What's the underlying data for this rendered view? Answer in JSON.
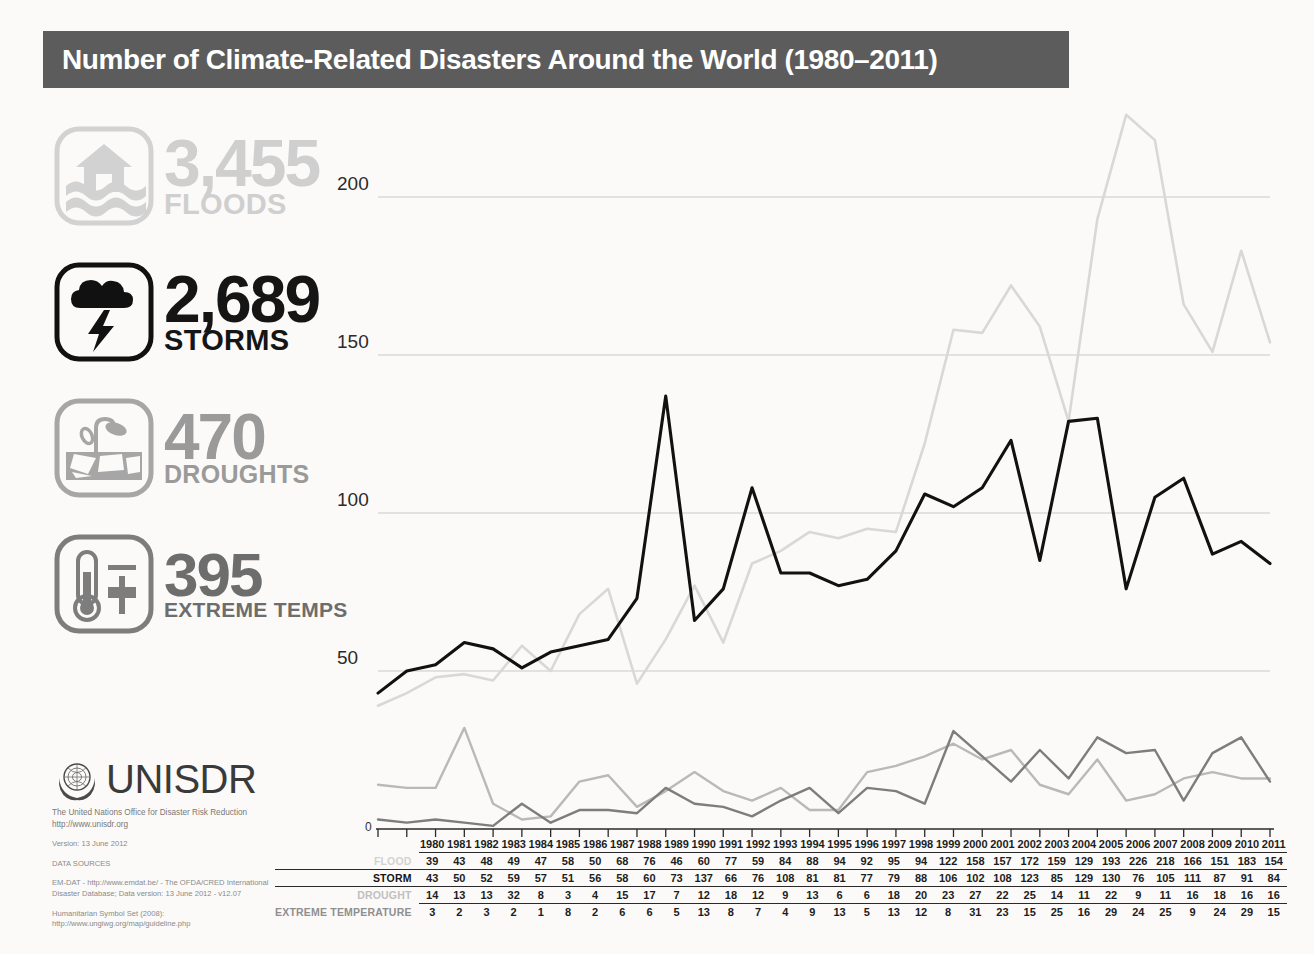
{
  "header": {
    "title": "Number of Climate-Related Disasters Around the World (1980–2011)",
    "bar_color": "#5c5c5c"
  },
  "stats": [
    {
      "key": "floods",
      "icon": "flood-house-waves-icon",
      "number": "3,455",
      "label": "FLOODS",
      "color": "#cfcfcf"
    },
    {
      "key": "storms",
      "icon": "storm-cloud-lightning-icon",
      "number": "2,689",
      "label": "STORMS",
      "color": "#151515"
    },
    {
      "key": "droughts",
      "icon": "drought-wilted-plant-icon",
      "number": "470",
      "label": "DROUGHTS",
      "color": "#9a9a9a"
    },
    {
      "key": "temps",
      "icon": "thermometer-plus-icon",
      "number": "395",
      "label": "EXTREME TEMPS",
      "color": "#6d6d6d"
    }
  ],
  "footer": {
    "logo_word": "UNISDR",
    "org_line": "The United Nations Office for Disaster Risk Reduction",
    "org_url": "http://www.unisdr.org",
    "version": "Version: 13 June 2012",
    "sources_heading": "DATA SOURCES",
    "source_1_a": "EM-DAT - http://www.emdat.be/ - The OFDA/CRED International",
    "source_1_b": "Disaster Database; Data version: 13 June 2012 - v12.07",
    "source_2_a": "Humanitarian Symbol Set (2008):",
    "source_2_b": "http://www.ungiwg.org/map/guideline.php"
  },
  "chart_data": {
    "type": "line",
    "title": "Number of Climate-Related Disasters Around the World (1980–2011)",
    "xlabel": "",
    "ylabel": "",
    "ylim": [
      0,
      230
    ],
    "yticks": [
      50,
      100,
      150,
      200
    ],
    "ytick_labels": [
      "50",
      "100",
      "150",
      "200"
    ],
    "zero_label": "0",
    "grid": true,
    "legend_position": "none",
    "x": [
      1980,
      1981,
      1982,
      1983,
      1984,
      1985,
      1986,
      1987,
      1988,
      1989,
      1990,
      1991,
      1992,
      1993,
      1994,
      1995,
      1996,
      1997,
      1998,
      1999,
      2000,
      2001,
      2002,
      2003,
      2004,
      2005,
      2006,
      2007,
      2008,
      2009,
      2010,
      2011
    ],
    "categories": [
      "1980",
      "1981",
      "1982",
      "1983",
      "1984",
      "1985",
      "1986",
      "1987",
      "1988",
      "1989",
      "1990",
      "1991",
      "1992",
      "1993",
      "1994",
      "1995",
      "1996",
      "1997",
      "1998",
      "1999",
      "2000",
      "2001",
      "2002",
      "2003",
      "2004",
      "2005",
      "2006",
      "2007",
      "2008",
      "2009",
      "2010",
      "2011"
    ],
    "series": [
      {
        "name": "FLOOD",
        "color": "#d8d8d8",
        "values": [
          39,
          43,
          48,
          49,
          47,
          58,
          50,
          68,
          76,
          46,
          60,
          77,
          59,
          84,
          88,
          94,
          92,
          95,
          94,
          122,
          158,
          157,
          172,
          159,
          129,
          193,
          226,
          218,
          166,
          151,
          183,
          154
        ]
      },
      {
        "name": "STORM",
        "color": "#111111",
        "values": [
          43,
          50,
          52,
          59,
          57,
          51,
          56,
          58,
          60,
          73,
          137,
          66,
          76,
          108,
          81,
          81,
          77,
          79,
          88,
          106,
          102,
          108,
          123,
          85,
          129,
          130,
          76,
          105,
          111,
          87,
          91,
          84
        ]
      },
      {
        "name": "DROUGHT",
        "color": "#b9b9b9",
        "values": [
          14,
          13,
          13,
          32,
          8,
          3,
          4,
          15,
          17,
          7,
          12,
          18,
          12,
          9,
          13,
          6,
          6,
          18,
          20,
          23,
          27,
          22,
          25,
          14,
          11,
          22,
          9,
          11,
          16,
          18,
          16,
          16
        ]
      },
      {
        "name": "EXTREME TEMPERATURE",
        "color": "#7d7d7d",
        "values": [
          3,
          2,
          3,
          2,
          1,
          8,
          2,
          6,
          6,
          5,
          13,
          8,
          7,
          4,
          9,
          13,
          5,
          13,
          12,
          8,
          31,
          23,
          15,
          25,
          16,
          29,
          24,
          25,
          9,
          24,
          29,
          15
        ]
      }
    ]
  },
  "table": {
    "row_labels": [
      "",
      "FLOOD",
      "STORM",
      "DROUGHT",
      "EXTREME TEMPERATURE"
    ]
  }
}
